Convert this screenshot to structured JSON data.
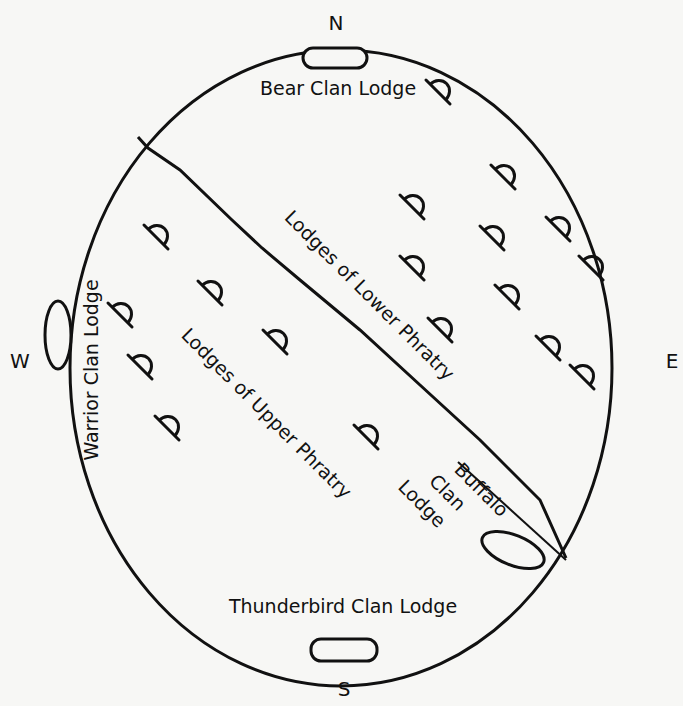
{
  "diagram": {
    "compass": {
      "north": "N",
      "south": "S",
      "east": "E",
      "west": "W"
    },
    "labels": {
      "bear": "Bear Clan Lodge",
      "warrior": "Warrior Clan Lodge",
      "thunderbird": "Thunderbird Clan Lodge",
      "buffalo_line1": "Buffalo",
      "buffalo_line2": "Clan",
      "buffalo_line3": "Lodge",
      "lower_phratry": "Lodges of Lower Phratry",
      "upper_phratry": "Lodges of Upper Phratry"
    },
    "colors": {
      "ink": "#111111",
      "paper": "#f7f7f5"
    },
    "lower_phratry_lodges": [
      {
        "x": 438,
        "y": 92
      },
      {
        "x": 503,
        "y": 177
      },
      {
        "x": 412,
        "y": 207
      },
      {
        "x": 558,
        "y": 229
      },
      {
        "x": 492,
        "y": 238
      },
      {
        "x": 591,
        "y": 268
      },
      {
        "x": 412,
        "y": 268
      },
      {
        "x": 507,
        "y": 297
      },
      {
        "x": 440,
        "y": 330
      },
      {
        "x": 548,
        "y": 348
      },
      {
        "x": 582,
        "y": 377
      }
    ],
    "upper_phratry_lodges": [
      {
        "x": 156,
        "y": 237
      },
      {
        "x": 120,
        "y": 315
      },
      {
        "x": 210,
        "y": 293
      },
      {
        "x": 140,
        "y": 367
      },
      {
        "x": 275,
        "y": 342
      },
      {
        "x": 167,
        "y": 428
      },
      {
        "x": 366,
        "y": 437
      }
    ]
  }
}
